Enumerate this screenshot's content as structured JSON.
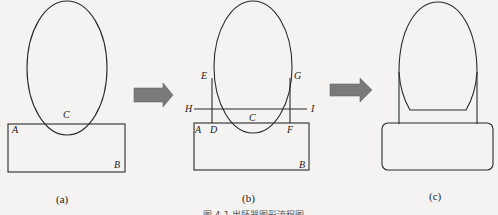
{
  "panels": {
    "a": {
      "caption": "(a)",
      "points": {
        "A": "A",
        "B": "B",
        "C": "C"
      }
    },
    "b": {
      "caption": "(b)",
      "points": {
        "A": "A",
        "B": "B",
        "C": "C",
        "D": "D",
        "E": "E",
        "F": "F",
        "G": "G",
        "H": "H",
        "I": "I"
      }
    },
    "c": {
      "caption": "(c)"
    }
  },
  "arrows": [
    {
      "from": "a",
      "to": "b",
      "color": "#7a7a7a"
    },
    {
      "from": "b",
      "to": "c",
      "color": "#7a7a7a"
    }
  ],
  "figure_caption": "图 4-1  出胚器图形流程图"
}
